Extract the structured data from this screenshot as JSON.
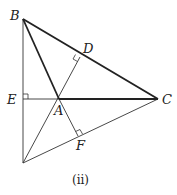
{
  "diagram": {
    "caption": "(ii)",
    "points": {
      "B": {
        "label": "B",
        "x": 23,
        "y": 19
      },
      "E": {
        "label": "E",
        "x": 23,
        "y": 99
      },
      "A": {
        "label": "A",
        "x": 59,
        "y": 99
      },
      "C": {
        "label": "C",
        "x": 158,
        "y": 99
      },
      "D": {
        "label": "D",
        "x": 80,
        "y": 57
      },
      "F": {
        "label": "F",
        "x": 78,
        "y": 136
      },
      "P": {
        "label": "",
        "x": 23,
        "y": 163
      }
    },
    "segments": [
      {
        "from": "B",
        "to": "C",
        "style": "thick"
      },
      {
        "from": "B",
        "to": "A",
        "style": "thick"
      },
      {
        "from": "A",
        "to": "C",
        "style": "thick"
      },
      {
        "from": "B",
        "to": "P",
        "style": "thin"
      },
      {
        "from": "E",
        "to": "A",
        "style": "thin"
      },
      {
        "from": "P",
        "to": "C",
        "style": "thin"
      },
      {
        "from": "P",
        "to": "D",
        "style": "thin"
      },
      {
        "from": "A",
        "to": "F",
        "style": "thin"
      }
    ],
    "right_angles": [
      "E",
      "D",
      "F"
    ]
  }
}
